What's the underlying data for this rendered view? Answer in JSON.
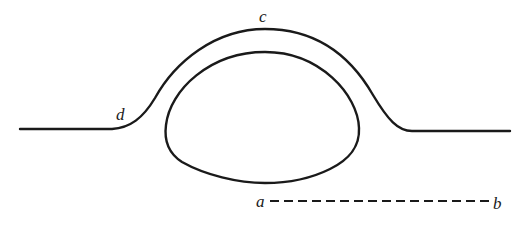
{
  "diagram": {
    "stroke_color": "#1a1a1a",
    "background": "#ffffff",
    "labels": {
      "c": "c",
      "d": "d",
      "a": "a",
      "b": "b"
    },
    "elements": [
      {
        "id": "outer-surface",
        "type": "curve",
        "note": "flat baseline rising to dome, labeled c at top and d on left flank"
      },
      {
        "id": "inner-loop",
        "type": "closed-curve",
        "note": "egg-shaped loop beneath the dome"
      },
      {
        "id": "reference-line",
        "type": "dashed-line",
        "from": "a",
        "to": "b"
      }
    ]
  }
}
